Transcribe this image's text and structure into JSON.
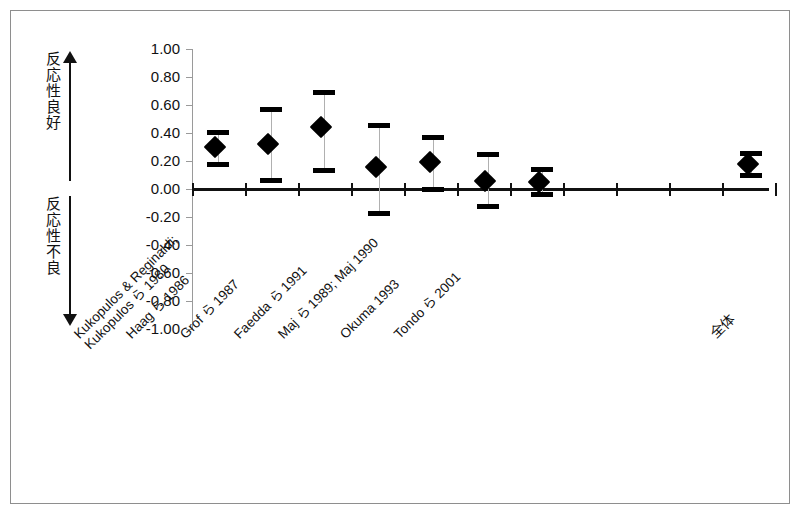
{
  "chart_data": {
    "type": "scatter",
    "plot_kind": "forest-plot",
    "title": "",
    "xlabel": "",
    "ylabel": "",
    "ylim": [
      -1.0,
      1.0
    ],
    "ytick_labels": [
      "1.00",
      "0.80",
      "0.60",
      "0.40",
      "0.20",
      "0.00",
      "-0.20",
      "-0.40",
      "-0.60",
      "-0.80",
      "-1.00"
    ],
    "ytick_values": [
      1.0,
      0.8,
      0.6,
      0.4,
      0.2,
      0.0,
      -0.2,
      -0.4,
      -0.6,
      -0.8,
      -1.0
    ],
    "grid": false,
    "legend": "none",
    "zero_reference_line": 0.0,
    "categories": [
      "Kukopulos & Reginaldi;\nKukopulos ら 1980",
      "Haag ら 1986",
      "Grof ら 1987",
      "Faedda ら 1991",
      "Maj ら 1989; Maj 1990",
      "Okuma 1993",
      "Tondo ら 2001",
      "全体"
    ],
    "points": [
      {
        "label": "Kukopulos & Reginaldi; Kukopulos ら 1980",
        "label_line1": "Kukopulos & Reginaldi;",
        "label_line2": "Kukopulos ら 1980",
        "value": 0.3,
        "ci_low": 0.17,
        "ci_high": 0.41
      },
      {
        "label": "Haag ら 1986",
        "label_line1": "Haag ら 1986",
        "label_line2": "",
        "value": 0.32,
        "ci_low": 0.06,
        "ci_high": 0.57
      },
      {
        "label": "Grof ら 1987",
        "label_line1": "Grof ら 1987",
        "label_line2": "",
        "value": 0.44,
        "ci_low": 0.13,
        "ci_high": 0.69
      },
      {
        "label": "Faedda ら 1991",
        "label_line1": "Faedda ら 1991",
        "label_line2": "",
        "value": 0.16,
        "ci_low": -0.18,
        "ci_high": 0.46
      },
      {
        "label": "Maj ら 1989; Maj 1990",
        "label_line1": "Maj ら 1989; Maj 1990",
        "label_line2": "",
        "value": 0.19,
        "ci_low": -0.01,
        "ci_high": 0.37
      },
      {
        "label": "Okuma 1993",
        "label_line1": "Okuma 1993",
        "label_line2": "",
        "value": 0.06,
        "ci_low": -0.13,
        "ci_high": 0.25
      },
      {
        "label": "Tondo ら 2001",
        "label_line1": "Tondo ら 2001",
        "label_line2": "",
        "value": 0.05,
        "ci_low": -0.04,
        "ci_high": 0.14
      },
      {
        "label": "全体",
        "label_line1": "全体",
        "label_line2": "",
        "value": 0.18,
        "ci_low": 0.09,
        "ci_high": 0.26
      }
    ],
    "annotations": {
      "upper_direction_text": "反応性良好",
      "lower_direction_text": "反応性不良",
      "upper_arrow": "up-arrow",
      "lower_arrow": "down-arrow"
    },
    "colors": {
      "marker": "#000000",
      "ci_cap": "#000000",
      "ci_line": "#b0b0b0",
      "axis": "#9a9a9a",
      "zero_line": "#111111",
      "frame": "#8e8e8e",
      "background": "#ffffff"
    }
  }
}
